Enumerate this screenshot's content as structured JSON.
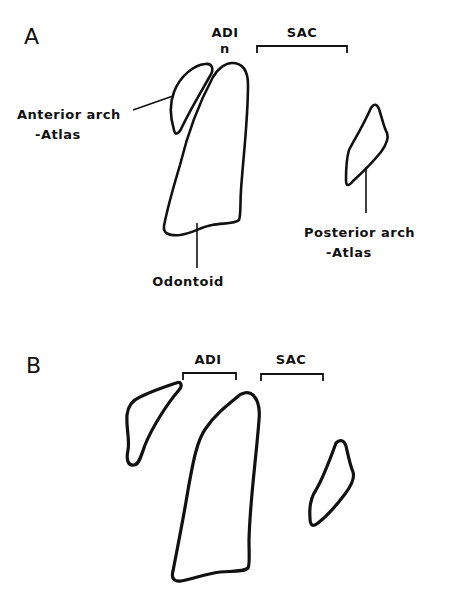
{
  "panels": {
    "a": {
      "letter": "A",
      "measure_labels": {
        "adi": "ADI",
        "adi_mark": "n",
        "sac": "SAC"
      },
      "structure_labels": {
        "anterior_arch_line1": "Anterior arch",
        "anterior_arch_line2": "-Atlas",
        "odontoid": "Odontoid",
        "posterior_arch_line1": "Posterior arch",
        "posterior_arch_line2": "-Atlas"
      }
    },
    "b": {
      "letter": "B",
      "measure_labels": {
        "adi": "ADI",
        "sac": "SAC"
      }
    }
  },
  "style": {
    "line_color": "#111111",
    "background": "#ffffff"
  }
}
